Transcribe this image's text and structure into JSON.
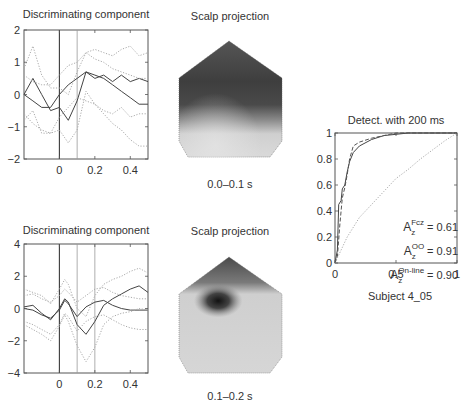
{
  "figure": {
    "top_left": {
      "title": "Discriminating component",
      "x_ticks": [
        "0",
        "0.2",
        "0.4"
      ],
      "y_ticks": [
        "2",
        "1",
        "0",
        "−1",
        "−2"
      ]
    },
    "top_scalp": {
      "title": "Scalp projection",
      "caption": "0.0–0.1 s"
    },
    "bottom_left": {
      "title": "Discriminating component",
      "x_ticks": [
        "0",
        "0.2",
        "0.4"
      ],
      "y_ticks": [
        "4",
        "2",
        "0",
        "−2",
        "−4"
      ]
    },
    "bottom_scalp": {
      "title": "Scalp projection",
      "caption": "0.1–0.2 s"
    },
    "roc": {
      "title": "Detect. with 200 ms",
      "x_ticks": [
        "0",
        "0.5",
        "1"
      ],
      "y_ticks": [
        "1",
        "0.8",
        "0.6",
        "0.4",
        "0.2",
        "0"
      ],
      "legend": [
        {
          "base": "A",
          "sub": "z",
          "sup": "Fcz",
          "value": "= 0.61"
        },
        {
          "base": "A",
          "sub": "z",
          "sup": "OO",
          "value": "= 0.91"
        },
        {
          "base": "A",
          "sub": "z",
          "sup": "On-line",
          "value": "= 0.90"
        }
      ],
      "caption": "Subject 4_05"
    }
  },
  "chart_data": [
    {
      "type": "line",
      "title": "Discriminating component",
      "xlabel": "",
      "ylabel": "",
      "xlim": [
        -0.2,
        0.5
      ],
      "ylim": [
        -2,
        2
      ],
      "x_ticks": [
        0,
        0.2,
        0.4
      ],
      "y_ticks": [
        -2,
        -1,
        0,
        1,
        2
      ],
      "vertical_lines": [
        0,
        0.1
      ],
      "x": [
        -0.2,
        -0.15,
        -0.1,
        -0.05,
        0.0,
        0.05,
        0.1,
        0.15,
        0.2,
        0.25,
        0.3,
        0.35,
        0.4,
        0.45,
        0.5
      ],
      "series": [
        {
          "name": "class A mean",
          "style": "solid",
          "values": [
            0.0,
            0.5,
            0.0,
            -0.5,
            -0.4,
            -0.8,
            -0.2,
            0.7,
            0.5,
            0.6,
            0.4,
            0.6,
            0.4,
            0.5,
            0.4
          ]
        },
        {
          "name": "class B mean",
          "style": "solid",
          "values": [
            0.0,
            -0.2,
            -0.4,
            -0.4,
            0.0,
            0.3,
            0.5,
            0.7,
            0.6,
            0.5,
            0.3,
            0.1,
            -0.1,
            -0.3,
            -0.3
          ]
        },
        {
          "name": "class A upper",
          "style": "dotted",
          "values": [
            0.8,
            1.5,
            0.6,
            0.2,
            0.2,
            0.0,
            0.7,
            1.3,
            1.4,
            1.3,
            1.2,
            1.4,
            1.5,
            1.2,
            1.3
          ]
        },
        {
          "name": "class A lower",
          "style": "dotted",
          "values": [
            -0.8,
            -0.5,
            -1.2,
            -1.2,
            -1.1,
            -1.5,
            -1.1,
            0.1,
            -0.3,
            -0.5,
            -0.6,
            -0.4,
            -0.7,
            -0.6,
            -0.6
          ]
        },
        {
          "name": "class B upper",
          "style": "dotted",
          "values": [
            0.6,
            0.4,
            0.3,
            0.3,
            0.6,
            0.9,
            1.0,
            1.3,
            1.1,
            1.0,
            0.8,
            0.7,
            0.6,
            0.5,
            0.5
          ]
        },
        {
          "name": "class B lower",
          "style": "dotted",
          "values": [
            -0.6,
            -0.9,
            -1.1,
            -1.2,
            -0.7,
            -0.4,
            -0.1,
            -0.2,
            -0.3,
            -0.6,
            -0.9,
            -1.1,
            -1.4,
            -1.6,
            -1.6
          ]
        }
      ]
    },
    {
      "type": "line",
      "title": "Discriminating component",
      "xlabel": "",
      "ylabel": "",
      "xlim": [
        -0.2,
        0.5
      ],
      "ylim": [
        -4,
        4
      ],
      "x_ticks": [
        0,
        0.2,
        0.4
      ],
      "y_ticks": [
        -4,
        -2,
        0,
        2,
        4
      ],
      "vertical_lines": [
        0,
        0.1,
        0.2
      ],
      "x": [
        -0.2,
        -0.15,
        -0.1,
        -0.05,
        0.0,
        0.03,
        0.05,
        0.1,
        0.15,
        0.2,
        0.25,
        0.3,
        0.35,
        0.4,
        0.45,
        0.5
      ],
      "series": [
        {
          "name": "class A mean",
          "style": "solid",
          "values": [
            0.1,
            0.2,
            -0.3,
            -0.7,
            0.0,
            0.6,
            0.4,
            -1.0,
            -1.6,
            -0.8,
            0.2,
            0.6,
            0.9,
            1.2,
            1.4,
            1.0
          ]
        },
        {
          "name": "class B mean",
          "style": "solid",
          "values": [
            0.0,
            -0.1,
            -0.4,
            -0.6,
            -0.1,
            0.5,
            0.3,
            -0.5,
            0.1,
            0.4,
            0.5,
            0.2,
            0.0,
            -0.1,
            -0.1,
            -0.1
          ]
        },
        {
          "name": "class A upper",
          "style": "dotted",
          "values": [
            1.2,
            1.0,
            0.8,
            0.3,
            1.2,
            1.8,
            1.5,
            0.0,
            -0.5,
            0.8,
            1.5,
            1.8,
            2.0,
            2.3,
            2.5,
            2.2
          ]
        },
        {
          "name": "class A lower",
          "style": "dotted",
          "values": [
            -1.0,
            -1.3,
            -1.6,
            -2.0,
            -1.1,
            -0.4,
            -0.8,
            -2.3,
            -3.3,
            -2.4,
            -1.0,
            -0.5,
            -0.3,
            -0.2,
            0.0,
            -0.1
          ]
        },
        {
          "name": "class B upper",
          "style": "dotted",
          "values": [
            0.8,
            0.9,
            0.6,
            0.4,
            0.8,
            1.2,
            1.0,
            0.4,
            0.8,
            1.2,
            1.3,
            1.0,
            0.8,
            0.7,
            0.6,
            0.6
          ]
        },
        {
          "name": "class B lower",
          "style": "dotted",
          "values": [
            -0.8,
            -1.0,
            -1.3,
            -1.6,
            -1.0,
            -0.3,
            -0.5,
            -1.4,
            -0.8,
            -0.5,
            -0.4,
            -0.7,
            -1.0,
            -1.2,
            -1.3,
            -1.3
          ]
        }
      ]
    },
    {
      "type": "line",
      "title": "Detect. with 200 ms",
      "xlabel": "",
      "ylabel": "",
      "xlim": [
        0,
        1
      ],
      "ylim": [
        0,
        1
      ],
      "x_ticks": [
        0,
        0.5,
        1
      ],
      "y_ticks": [
        0,
        0.2,
        0.4,
        0.6,
        0.8,
        1
      ],
      "series": [
        {
          "name": "Az OO = 0.91",
          "style": "solid",
          "x": [
            0.0,
            0.02,
            0.03,
            0.05,
            0.06,
            0.08,
            0.1,
            0.12,
            0.15,
            0.2,
            0.3,
            0.4,
            0.5,
            0.6,
            1.0
          ],
          "y": [
            0.0,
            0.1,
            0.45,
            0.48,
            0.57,
            0.6,
            0.7,
            0.78,
            0.85,
            0.9,
            0.95,
            0.98,
            0.99,
            1.0,
            1.0
          ]
        },
        {
          "name": "Az On-line = 0.90",
          "style": "dashed",
          "x": [
            0.0,
            0.02,
            0.04,
            0.06,
            0.08,
            0.1,
            0.12,
            0.15,
            0.2,
            0.3,
            0.4,
            0.5,
            1.0
          ],
          "y": [
            0.0,
            0.05,
            0.3,
            0.5,
            0.58,
            0.68,
            0.8,
            0.9,
            0.93,
            0.96,
            0.98,
            1.0,
            1.0
          ]
        },
        {
          "name": "Az Fcz = 0.61",
          "style": "dotted",
          "x": [
            0.0,
            0.05,
            0.1,
            0.2,
            0.3,
            0.4,
            0.5,
            0.6,
            0.7,
            0.8,
            0.9,
            1.0
          ],
          "y": [
            0.0,
            0.1,
            0.2,
            0.35,
            0.45,
            0.55,
            0.65,
            0.72,
            0.8,
            0.87,
            0.94,
            1.0
          ]
        }
      ],
      "annotations": [
        "Az Fcz = 0.61",
        "Az OO = 0.91",
        "Az On-line = 0.90"
      ],
      "caption": "Subject 4_05"
    }
  ]
}
